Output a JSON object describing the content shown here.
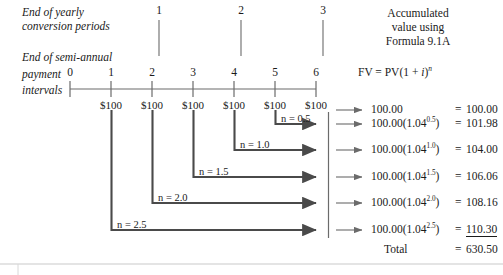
{
  "labels": {
    "yearly_line1": "End of yearly",
    "yearly_line2": "conversion periods",
    "semi_line1": "End of semi-annual",
    "semi_line2": "payment",
    "semi_line3": "intervals"
  },
  "header": {
    "line1": "Accumulated",
    "line2": "value using",
    "line3": "Formula 9.1A",
    "formula_prefix": "FV = PV(1 + ",
    "formula_i": "i",
    "formula_close": ")",
    "formula_exp": "n"
  },
  "timeline": {
    "tick_labels": [
      "0",
      "1",
      "2",
      "3",
      "4",
      "5",
      "6"
    ],
    "year_labels": [
      "1",
      "2",
      "3"
    ],
    "payment_labels": [
      "$100",
      "$100",
      "$100",
      "$100",
      "$100",
      "$100"
    ]
  },
  "brackets": [
    {
      "n_label": "n = 0.5",
      "from_tick": 5
    },
    {
      "n_label": "n = 1.0",
      "from_tick": 4
    },
    {
      "n_label": "n = 1.5",
      "from_tick": 3
    },
    {
      "n_label": "n = 2.0",
      "from_tick": 2
    },
    {
      "n_label": "n = 2.5",
      "from_tick": 1
    }
  ],
  "calculations": [
    {
      "expr_base": "100.00",
      "expr_rest": "",
      "exp": "",
      "eq": "=",
      "value": "100.00"
    },
    {
      "expr_base": "100.00(1.04",
      "expr_rest": ")",
      "exp": "0.5",
      "eq": "=",
      "value": "101.98"
    },
    {
      "expr_base": "100.00(1.04",
      "expr_rest": ")",
      "exp": "1.0",
      "eq": "=",
      "value": "104.00"
    },
    {
      "expr_base": "100.00(1.04",
      "expr_rest": ")",
      "exp": "1.5",
      "eq": "=",
      "value": "106.06"
    },
    {
      "expr_base": "100.00(1.04",
      "expr_rest": ")",
      "exp": "2.0",
      "eq": "=",
      "value": "108.16"
    },
    {
      "expr_base": "100.00(1.04",
      "expr_rest": ")",
      "exp": "2.5",
      "eq": "=",
      "value": "110.30"
    }
  ],
  "total": {
    "label": "Total",
    "eq": "=",
    "value": "630.50"
  },
  "colors": {
    "ink": "#1a1a1a",
    "rule": "#6b6b6b",
    "bracket": "#4a4a4a"
  }
}
